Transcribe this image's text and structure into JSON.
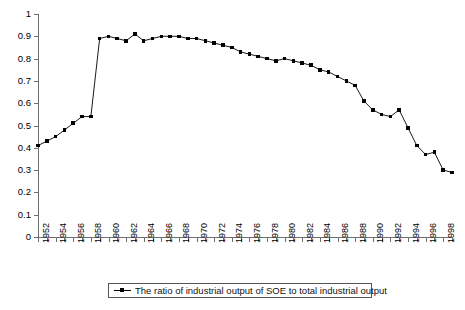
{
  "chart_data": {
    "type": "line",
    "title": "",
    "subtitle": "",
    "xlabel": "",
    "ylabel": "",
    "ylim": [
      0,
      1
    ],
    "xlim": [
      1952,
      1999
    ],
    "grid": false,
    "legend_position": "bottom",
    "marker": "square",
    "series_color": "#000000",
    "ytick_labels": [
      "1",
      "0.9",
      "0.8",
      "0.7",
      "0.6",
      "0.5",
      "0.4",
      "0.3",
      "0.2",
      "0.1",
      "0"
    ],
    "ytick_values": [
      1,
      0.9,
      0.8,
      0.7,
      0.6,
      0.5,
      0.4,
      0.3,
      0.2,
      0.1,
      0
    ],
    "xtick_labels": [
      "1952",
      "1954",
      "1956",
      "1958",
      "1960",
      "1962",
      "1964",
      "1966",
      "1968",
      "1970",
      "1972",
      "1974",
      "1976",
      "1978",
      "1980",
      "1982",
      "1984",
      "1986",
      "1988",
      "1990",
      "1992",
      "1994",
      "1996",
      "1998"
    ],
    "x": [
      1952,
      1953,
      1954,
      1955,
      1956,
      1957,
      1958,
      1959,
      1960,
      1961,
      1962,
      1963,
      1964,
      1965,
      1966,
      1967,
      1968,
      1969,
      1970,
      1971,
      1972,
      1973,
      1974,
      1975,
      1976,
      1977,
      1978,
      1979,
      1980,
      1981,
      1982,
      1983,
      1984,
      1985,
      1986,
      1987,
      1988,
      1989,
      1990,
      1991,
      1992,
      1993,
      1994,
      1995,
      1996,
      1997,
      1998,
      1999
    ],
    "series": [
      {
        "name": "The ratio of industrial output of SOE to total industrial output",
        "values": [
          0.41,
          0.43,
          0.45,
          0.48,
          0.51,
          0.54,
          0.54,
          0.89,
          0.9,
          0.89,
          0.88,
          0.91,
          0.88,
          0.89,
          0.9,
          0.9,
          0.9,
          0.89,
          0.89,
          0.88,
          0.87,
          0.86,
          0.85,
          0.83,
          0.82,
          0.81,
          0.8,
          0.79,
          0.8,
          0.79,
          0.78,
          0.77,
          0.75,
          0.74,
          0.72,
          0.7,
          0.68,
          0.61,
          0.57,
          0.55,
          0.54,
          0.57,
          0.49,
          0.41,
          0.37,
          0.38,
          0.3,
          0.29
        ]
      }
    ],
    "legend": [
      {
        "label": "The ratio of industrial output of SOE to total industrial output",
        "color": "#000000",
        "marker": "square"
      }
    ]
  }
}
